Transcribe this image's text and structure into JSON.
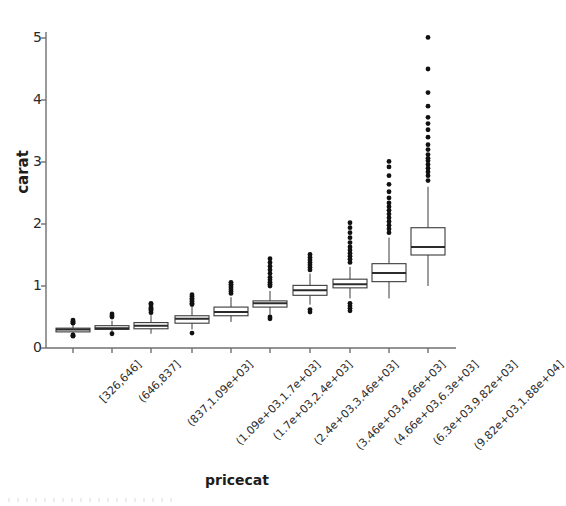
{
  "chart_data": {
    "type": "box",
    "title": "",
    "xlabel": "pricecat",
    "ylabel": "carat",
    "ylim": [
      0,
      5.3
    ],
    "yticks": [
      0,
      1,
      2,
      3,
      4,
      5
    ],
    "ytick_labels": [
      "0",
      "1",
      "2",
      "3",
      "4",
      "5"
    ],
    "grid": false,
    "legend": "none",
    "box_fill": "#ffffff",
    "line_color": "#3a3a3a",
    "median_color": "#2b2b2b",
    "outlier_color": "#111111",
    "categories": [
      "[326,646]",
      "(646,837]",
      "(837,1.09e+03]",
      "(1.09e+03,1.7e+03]",
      "(1.7e+03,2.4e+03]",
      "(2.4e+03,3.46e+03]",
      "(3.46e+03,4.66e+03]",
      "(4.66e+03,6.3e+03]",
      "(6.3e+03,9.82e+03]",
      "(9.82e+03,1.88e+04]"
    ],
    "boxes": [
      {
        "category": "[326,646]",
        "q1": 0.26,
        "median": 0.3,
        "q3": 0.32,
        "whisker_low": 0.22,
        "whisker_high": 0.37,
        "outliers": [
          0.4,
          0.41,
          0.43,
          0.45,
          0.21,
          0.2,
          0.19
        ]
      },
      {
        "category": "(646,837]",
        "q1": 0.3,
        "median": 0.32,
        "q3": 0.36,
        "whisker_low": 0.24,
        "whisker_high": 0.44,
        "outliers": [
          0.5,
          0.52,
          0.55,
          0.23
        ]
      },
      {
        "category": "(837,1.09e+03]",
        "q1": 0.31,
        "median": 0.36,
        "q3": 0.41,
        "whisker_low": 0.23,
        "whisker_high": 0.53,
        "outliers": [
          0.57,
          0.6,
          0.62,
          0.64,
          0.66,
          0.7,
          0.72
        ]
      },
      {
        "category": "(1.09e+03,1.7e+03]",
        "q1": 0.4,
        "median": 0.47,
        "q3": 0.52,
        "whisker_low": 0.3,
        "whisker_high": 0.66,
        "outliers": [
          0.7,
          0.72,
          0.75,
          0.78,
          0.8,
          0.83,
          0.86,
          0.24
        ]
      },
      {
        "category": "(1.7e+03,2.4e+03]",
        "q1": 0.52,
        "median": 0.58,
        "q3": 0.66,
        "whisker_low": 0.42,
        "whisker_high": 0.82,
        "outliers": [
          0.88,
          0.91,
          0.94,
          0.97,
          1.0,
          1.03,
          1.06
        ]
      },
      {
        "category": "(2.4e+03,3.46e+03]",
        "q1": 0.66,
        "median": 0.72,
        "q3": 0.76,
        "whisker_low": 0.54,
        "whisker_high": 0.92,
        "outliers": [
          1.0,
          1.03,
          1.06,
          1.1,
          1.14,
          1.2,
          1.26,
          1.32,
          1.38,
          1.44,
          0.5,
          0.47
        ]
      },
      {
        "category": "(3.46e+03,4.66e+03]",
        "q1": 0.85,
        "median": 0.93,
        "q3": 1.01,
        "whisker_low": 0.7,
        "whisker_high": 1.2,
        "outliers": [
          1.26,
          1.3,
          1.34,
          1.38,
          1.42,
          1.46,
          1.51,
          0.62,
          0.58
        ]
      },
      {
        "category": "(4.66e+03,6.3e+03]",
        "q1": 0.97,
        "median": 1.03,
        "q3": 1.11,
        "whisker_low": 0.8,
        "whisker_high": 1.31,
        "outliers": [
          1.38,
          1.43,
          1.48,
          1.53,
          1.58,
          1.63,
          1.7,
          1.78,
          1.86,
          1.94,
          2.02,
          0.72,
          0.68,
          0.64,
          0.6
        ]
      },
      {
        "category": "(6.3e+03,9.82e+03]",
        "q1": 1.07,
        "median": 1.21,
        "q3": 1.36,
        "whisker_low": 0.8,
        "whisker_high": 1.78,
        "outliers": [
          1.86,
          1.92,
          1.98,
          2.04,
          2.1,
          2.16,
          2.22,
          2.28,
          2.34,
          2.42,
          2.52,
          2.64,
          2.78,
          2.92,
          3.01
        ]
      },
      {
        "category": "(9.82e+03,1.88e+04]",
        "q1": 1.5,
        "median": 1.63,
        "q3": 1.94,
        "whisker_low": 1.0,
        "whisker_high": 2.6,
        "outliers": [
          2.7,
          2.78,
          2.84,
          2.9,
          2.96,
          3.02,
          3.06,
          3.12,
          3.2,
          3.28,
          3.4,
          3.52,
          3.62,
          3.72,
          3.9,
          4.12,
          4.5,
          5.01
        ]
      }
    ]
  },
  "geometry": {
    "plot_left": 46,
    "plot_right": 456,
    "y_zero_px": 348,
    "px_per_unit": 62,
    "axis_top_px": 32,
    "box_half_width": 17,
    "x_centers": [
      73,
      112,
      151,
      192,
      231,
      270,
      310,
      350,
      389,
      428
    ]
  }
}
